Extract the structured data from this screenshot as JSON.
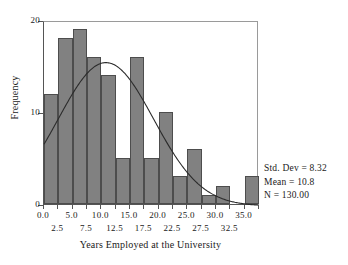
{
  "chart_data": {
    "type": "bar",
    "title": "",
    "xlabel": "Years Employed at the University",
    "ylabel": "Frequency",
    "xlim": [
      0,
      37.5
    ],
    "ylim": [
      0,
      20
    ],
    "bin_width": 2.5,
    "grid": false,
    "legend": "none",
    "bin_starts": [
      0,
      2.5,
      5,
      7.5,
      10,
      12.5,
      15,
      17.5,
      20,
      22.5,
      25,
      27.5,
      30,
      32.5,
      35
    ],
    "bin_centers": [
      1.25,
      3.75,
      6.25,
      8.75,
      11.25,
      13.75,
      16.25,
      18.75,
      21.25,
      23.75,
      26.25,
      28.75,
      31.25,
      33.75,
      36.25
    ],
    "values": [
      12,
      18,
      19,
      16,
      14,
      5,
      16,
      5,
      10,
      3,
      6,
      1,
      2,
      0,
      3
    ],
    "xticks_major": [
      "0.0",
      "5.0",
      "10.0",
      "15.0",
      "20.0",
      "25.0",
      "30.0",
      "35.0"
    ],
    "xticks_major_values": [
      0,
      5,
      10,
      15,
      20,
      25,
      30,
      35
    ],
    "xticks_minor": [
      "2.5",
      "7.5",
      "12.5",
      "17.5",
      "22.5",
      "27.5",
      "32.5"
    ],
    "xticks_minor_values": [
      2.5,
      7.5,
      12.5,
      17.5,
      22.5,
      27.5,
      32.5
    ],
    "yticks": [
      "0",
      "10",
      "20"
    ],
    "yticks_values": [
      0,
      10,
      20
    ],
    "overlay_curve": {
      "name": "normal-distribution-curve",
      "mean": 10.8,
      "std_dev": 8.32,
      "n": 130,
      "color": "#2b2b2b"
    },
    "bar_color": "#818181",
    "bar_edge_color": "#4d4d4d"
  },
  "stats": {
    "std_dev": "Std. Dev = 8.32",
    "mean": "Mean = 10.8",
    "n": "N = 130.00"
  }
}
